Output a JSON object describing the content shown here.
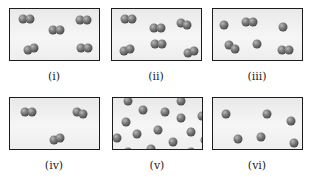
{
  "panels": [
    {
      "label": "(i)",
      "x": 9,
      "y": 8,
      "label_y": 70,
      "particles": [
        {
          "type": "diatomic",
          "x": 16,
          "y": 10,
          "angle": 0
        },
        {
          "type": "diatomic",
          "x": 46,
          "y": 21,
          "angle": 0
        },
        {
          "type": "diatomic",
          "x": 73,
          "y": 11,
          "angle": 0
        },
        {
          "type": "diatomic",
          "x": 21,
          "y": 40,
          "angle": -10
        },
        {
          "type": "diatomic",
          "x": 74,
          "y": 39,
          "angle": 0
        }
      ]
    },
    {
      "label": "(ii)",
      "x": 111,
      "y": 8,
      "label_y": 70,
      "particles": [
        {
          "type": "diatomic",
          "x": 16,
          "y": 10,
          "angle": 0
        },
        {
          "type": "diatomic",
          "x": 45,
          "y": 19,
          "angle": 0
        },
        {
          "type": "diatomic",
          "x": 72,
          "y": 15,
          "angle": 15
        },
        {
          "type": "diatomic",
          "x": 15,
          "y": 41,
          "angle": -10
        },
        {
          "type": "diatomic",
          "x": 46,
          "y": 35,
          "angle": 0
        },
        {
          "type": "diatomic",
          "x": 79,
          "y": 43,
          "angle": -10
        }
      ]
    },
    {
      "label": "(iii)",
      "x": 212,
      "y": 8,
      "label_y": 70,
      "particles": [
        {
          "type": "atom",
          "x": 11,
          "y": 16
        },
        {
          "type": "diatomic",
          "x": 36,
          "y": 13,
          "angle": 0
        },
        {
          "type": "atom",
          "x": 70,
          "y": 18
        },
        {
          "type": "diatomic",
          "x": 19,
          "y": 38,
          "angle": 30
        },
        {
          "type": "atom",
          "x": 44,
          "y": 35
        },
        {
          "type": "diatomic",
          "x": 72,
          "y": 41,
          "angle": 0
        }
      ]
    },
    {
      "label": "(iv)",
      "x": 9,
      "y": 97,
      "label_y": 159,
      "particles": [
        {
          "type": "diatomic",
          "x": 18,
          "y": 14,
          "angle": 0
        },
        {
          "type": "diatomic",
          "x": 70,
          "y": 15,
          "angle": 20
        },
        {
          "type": "diatomic",
          "x": 47,
          "y": 41,
          "angle": -20
        }
      ]
    },
    {
      "label": "(v)",
      "x": 112,
      "y": 97,
      "label_y": 159,
      "particles": [
        {
          "type": "atom",
          "x": 15,
          "y": 3
        },
        {
          "type": "atom",
          "x": 30,
          "y": 12
        },
        {
          "type": "atom",
          "x": 52,
          "y": 14
        },
        {
          "type": "atom",
          "x": 68,
          "y": 3
        },
        {
          "type": "atom",
          "x": 68,
          "y": 20
        },
        {
          "type": "atom",
          "x": 89,
          "y": 18
        },
        {
          "type": "atom",
          "x": 13,
          "y": 24
        },
        {
          "type": "atom",
          "x": 45,
          "y": 32
        },
        {
          "type": "atom",
          "x": 78,
          "y": 34
        },
        {
          "type": "atom",
          "x": 4,
          "y": 40
        },
        {
          "type": "atom",
          "x": 24,
          "y": 36
        },
        {
          "type": "atom",
          "x": 60,
          "y": 44
        },
        {
          "type": "atom",
          "x": 92,
          "y": 42
        },
        {
          "type": "atom",
          "x": 38,
          "y": 51
        },
        {
          "type": "atom",
          "x": 15,
          "y": 54
        },
        {
          "type": "atom",
          "x": 78,
          "y": 54
        }
      ]
    },
    {
      "label": "(vi)",
      "x": 212,
      "y": 97,
      "label_y": 159,
      "particles": [
        {
          "type": "atom",
          "x": 13,
          "y": 16
        },
        {
          "type": "atom",
          "x": 54,
          "y": 16
        },
        {
          "type": "atom",
          "x": 78,
          "y": 23
        },
        {
          "type": "atom",
          "x": 25,
          "y": 41
        },
        {
          "type": "atom",
          "x": 48,
          "y": 39
        },
        {
          "type": "atom",
          "x": 81,
          "y": 45
        }
      ]
    }
  ],
  "colors": {
    "border": "#1c1c1c",
    "panel_bg": "#efefef",
    "atom": "#6e6e6e",
    "label": "#222222"
  }
}
